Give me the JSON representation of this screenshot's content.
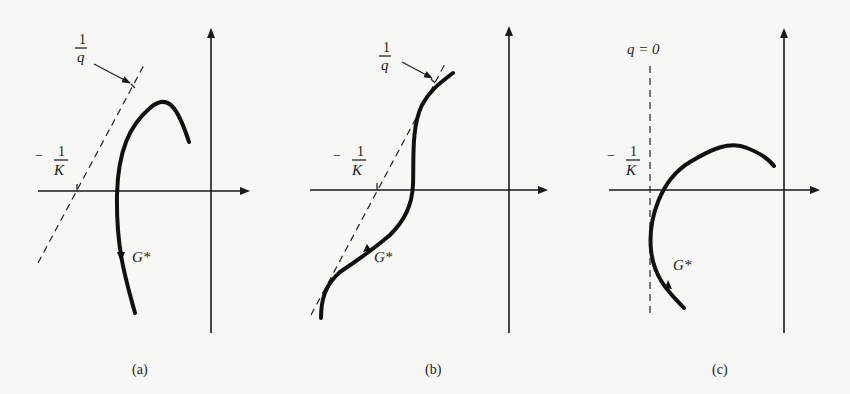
{
  "figure": {
    "panels": [
      {
        "id": "a",
        "caption": "(a)",
        "curve_label": "G*",
        "inverse_q_label": {
          "num": "1",
          "den": "q"
        },
        "neg_inverse_K_label": {
          "sign": "−",
          "num": "1",
          "den": "K"
        }
      },
      {
        "id": "b",
        "caption": "(b)",
        "curve_label": "G*",
        "inverse_q_label": {
          "num": "1",
          "den": "q"
        },
        "neg_inverse_K_label": {
          "sign": "−",
          "num": "1",
          "den": "K"
        }
      },
      {
        "id": "c",
        "caption": "(c)",
        "curve_label": "G*",
        "q_zero_label": "q = 0",
        "neg_inverse_K_label": {
          "sign": "−",
          "num": "1",
          "den": "K"
        }
      }
    ]
  }
}
